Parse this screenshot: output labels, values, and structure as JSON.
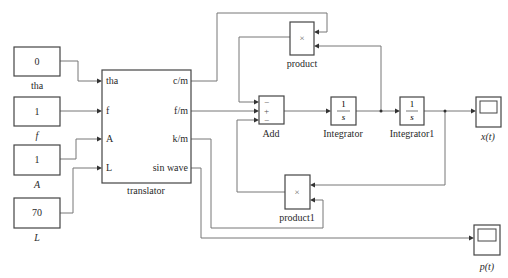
{
  "diagram": {
    "type": "simulink-block-diagram",
    "constants": [
      {
        "id": "tha",
        "value": "0",
        "label": "tha",
        "label_italic": false
      },
      {
        "id": "f",
        "value": "1",
        "label": "f",
        "label_italic": true
      },
      {
        "id": "A",
        "value": "1",
        "label": "A",
        "label_italic": true
      },
      {
        "id": "L",
        "value": "70",
        "label": "L",
        "label_italic": true
      }
    ],
    "translator": {
      "label": "translator",
      "inputs": [
        "tha",
        "f",
        "A",
        "L"
      ],
      "outputs": [
        "c/m",
        "f/m",
        "k/m",
        "sin wave"
      ]
    },
    "product": {
      "label": "product",
      "symbol": "×"
    },
    "product1": {
      "label": "product1",
      "symbol": "×"
    },
    "add": {
      "label": "Add",
      "signs": [
        "−",
        "+",
        "−"
      ]
    },
    "integrator": {
      "label": "Integrator",
      "num": "1",
      "den": "s"
    },
    "integrator1": {
      "label": "Integrator1",
      "num": "1",
      "den": "s"
    },
    "scope_x": {
      "label": "x(t)"
    },
    "scope_p": {
      "label": "p(t)"
    },
    "connections": [
      "tha -> translator.tha",
      "f -> translator.f",
      "A -> translator.A",
      "L -> translator.L",
      "translator.c/m -> product.in1",
      "translator.f/m -> Add.in2",
      "translator.k/m -> product1.in2",
      "translator.sin wave -> p(t)",
      "product.out -> Add.in1",
      "product1.out -> Add.in3",
      "Add.out -> Integrator",
      "Integrator.out -> Integrator1",
      "Integrator.out -> product.in2",
      "Integrator1.out -> x(t)",
      "Integrator1.out -> product1.in1"
    ]
  }
}
